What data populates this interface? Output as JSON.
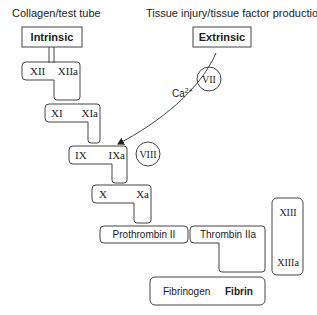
{
  "labels": {
    "intrinsic_trigger": "Collagen/test tube",
    "extrinsic_trigger": "Tissue injury/tissue factor production",
    "intrinsic": "Intrinsic",
    "extrinsic": "Extrinsic",
    "calcium": "Ca",
    "calcium_sup": "2+"
  },
  "factors": {
    "xii": "XII",
    "xiia": "XIIa",
    "xi": "XI",
    "xia": "XIa",
    "ix": "IX",
    "ixa": "IXa",
    "x": "X",
    "xa": "Xa",
    "vii": "VII",
    "viii": "VIII",
    "prothrombin": "Prothrombin II",
    "thrombin": "Thrombin IIa",
    "xiii": "XIII",
    "xiiia": "XIIIa",
    "fibrinogen": "Fibrinogen",
    "fibrin": "Fibrin"
  },
  "colors": {
    "stroke": "#444444",
    "text": "#222222",
    "background": "#ffffff"
  }
}
